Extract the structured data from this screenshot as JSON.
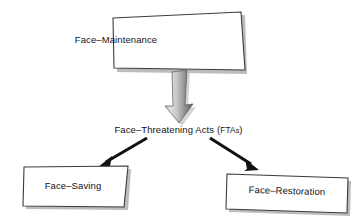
{
  "diagram": {
    "type": "flowchart",
    "background_color": "#ffffff",
    "text_color": "#141414",
    "box_fill": "#ffffff",
    "box_stroke": "#3a3a3a",
    "shadow_color": "#9a9a9a",
    "arrow_color": "#111111",
    "block_arrow_gradient_from": "#d9d9d9",
    "block_arrow_gradient_to": "#6f6f6f",
    "nodes": [
      {
        "id": "face-maintenance",
        "label": "Face–Maintenance",
        "shape": "skewed-box",
        "position": "top-center"
      },
      {
        "id": "face-threatening-acts",
        "label": "Face–Threatening Acts (FTAs)",
        "label_main": "Face–Threatening Acts (",
        "label_abbrev": "FTA",
        "label_plural": "s",
        "label_close": ")",
        "shape": "plain-text",
        "position": "middle-center"
      },
      {
        "id": "face-saving",
        "label": "Face–Saving",
        "shape": "skewed-box",
        "position": "bottom-left"
      },
      {
        "id": "face-restoration",
        "label": "Face–Restoration",
        "shape": "skewed-box",
        "position": "bottom-right"
      }
    ],
    "edges": [
      {
        "id": "edge-maintenance-to-ftas",
        "from": "face-maintenance",
        "to": "face-threatening-acts",
        "style": "block-arrow-gradient",
        "direction": "down"
      },
      {
        "id": "edge-ftas-to-saving",
        "from": "face-threatening-acts",
        "to": "face-saving",
        "style": "thin-solid-arrow",
        "direction": "down-left"
      },
      {
        "id": "edge-ftas-to-restoration",
        "from": "face-threatening-acts",
        "to": "face-restoration",
        "style": "thin-solid-arrow",
        "direction": "down-right"
      }
    ]
  }
}
